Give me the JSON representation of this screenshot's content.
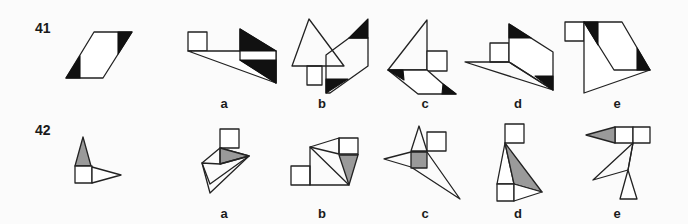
{
  "questions": [
    {
      "number": "41",
      "options": [
        "a",
        "b",
        "c",
        "d",
        "e"
      ]
    },
    {
      "number": "42",
      "options": [
        "a",
        "b",
        "c",
        "d",
        "e"
      ]
    }
  ],
  "colors": {
    "background": "#fbfbfb",
    "stroke": "#222222",
    "black_fill": "#111111",
    "gray_fill": "#9a9a9a"
  }
}
